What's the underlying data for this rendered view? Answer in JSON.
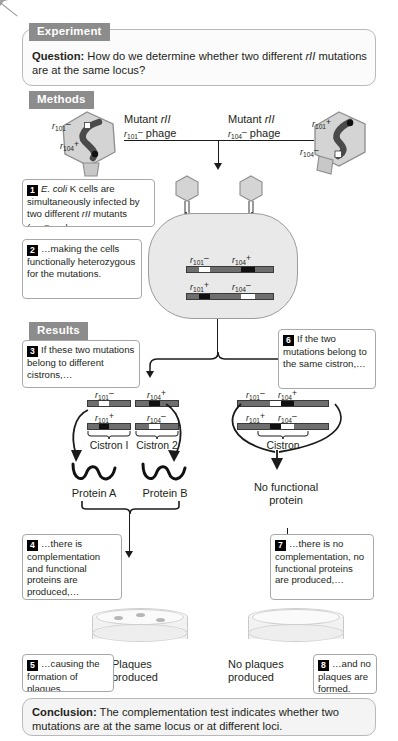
{
  "figure": {
    "sections": {
      "experiment_badge": "Experiment",
      "methods_badge": "Methods",
      "results_badge": "Results"
    },
    "question": {
      "label": "Question:",
      "text_part1": " How do we determine whether two different ",
      "gene": "rII",
      "text_part2": " mutations are at the same locus?"
    },
    "conclusion": {
      "label": "Conclusion:",
      "text": " The complementation test indicates whether two mutations are at the same locus or at different loci."
    },
    "methods": {
      "left_phage_label_line1": "Mutant",
      "left_phage_label_gene": "rII",
      "left_phage_label_line2_pre": "r",
      "left_phage_label_line2_sub": "101",
      "left_phage_label_line2_sup": "–",
      "left_phage_label_line2_post": " phage",
      "right_phage_label_line1": "Mutant",
      "right_phage_label_gene": "rII",
      "right_phage_label_line2_pre": "r",
      "right_phage_label_line2_sub": "104",
      "right_phage_label_line2_sup": "–",
      "right_phage_label_line2_post": " phage"
    },
    "callouts": [
      {
        "num": "1",
        "text": "E. coli K cells are simultaneously infected by two different rII mutants (r 101– and"
      },
      {
        "num": "2",
        "text": "…making the cells functionally heterozygous for the mutations."
      },
      {
        "num": "3",
        "text": "If these two mutations belong to different cistrons,…"
      },
      {
        "num": "4",
        "text": "…there is complementation and functional proteins are produced,…"
      },
      {
        "num": "5",
        "text": "…causing the formation of plaques."
      },
      {
        "num": "6",
        "text": "If the two mutations belong to the same cistron,…"
      },
      {
        "num": "7",
        "text": "…there is no complementation, no functional proteins are produced,…"
      },
      {
        "num": "8",
        "text": "…and no plaques are formed."
      }
    ],
    "labels": {
      "cistron1": "Cistron I",
      "cistron2": "Cistron 2",
      "cistron_single": "Cistron",
      "protein_a": "Protein A",
      "protein_b": "Protein B",
      "no_functional_protein_line1": "No functional",
      "no_functional_protein_line2": "protein",
      "plaques_line1": "Plaques",
      "plaques_line2": "produced",
      "no_plaques_line1": "No plaques",
      "no_plaques_line2": "produced"
    },
    "alleles": {
      "r101_minus": {
        "base": "r",
        "sub": "101",
        "sup": "–"
      },
      "r101_plus": {
        "base": "r",
        "sub": "101",
        "sup": "+"
      },
      "r104_minus": {
        "base": "r",
        "sub": "104",
        "sup": "–"
      },
      "r104_plus": {
        "base": "r",
        "sub": "104",
        "sup": "+"
      }
    },
    "colors": {
      "badge_gray": "#8c8c8c",
      "panel_border": "#b9b9b9",
      "dna_gray": "#6e6e6e",
      "mutation_white": "#ffffff",
      "wildtype_black": "#111111",
      "cell_fill": "#e9e9e9",
      "phage_fill": "#d2d2d2",
      "line_black": "#1b1b1b"
    },
    "dna_bars": {
      "cell_top": {
        "left_allele": "r101_minus",
        "right_allele": "r104_plus",
        "segments": [
          "gray",
          "white",
          "gray",
          "black",
          "gray"
        ]
      },
      "cell_bottom": {
        "left_allele": "r101_plus",
        "right_allele": "r104_minus",
        "segments": [
          "gray",
          "black",
          "gray",
          "white",
          "gray"
        ]
      },
      "left_top_1": {
        "allele": "r101_minus",
        "segments": [
          "gray",
          "white",
          "gray"
        ]
      },
      "left_top_2": {
        "allele": "r104_plus",
        "segments": [
          "gray",
          "black",
          "gray"
        ]
      },
      "left_bot_1": {
        "allele": "r101_plus",
        "segments": [
          "gray",
          "black",
          "gray"
        ]
      },
      "left_bot_2": {
        "allele": "r104_minus",
        "segments": [
          "gray",
          "white",
          "gray"
        ]
      },
      "right_top": {
        "left_allele": "r101_minus",
        "right_allele": "r104_plus",
        "segments": [
          "gray",
          "white",
          "black",
          "gray"
        ]
      },
      "right_bot": {
        "left_allele": "r101_plus",
        "right_allele": "r104_minus",
        "segments": [
          "gray",
          "black",
          "white",
          "gray"
        ]
      }
    }
  }
}
